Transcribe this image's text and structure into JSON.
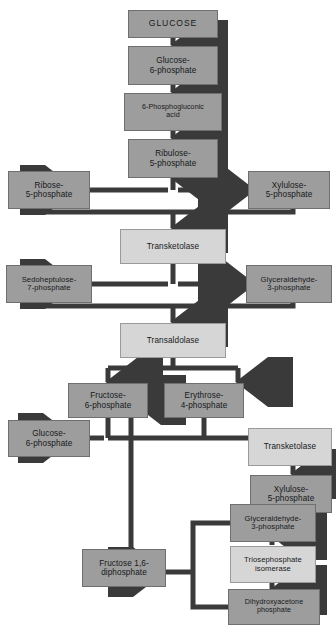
{
  "diagram": {
    "colors": {
      "metabolite_fill": "#9d9d9d",
      "enzyme_fill": "#d6d6d6",
      "arrow": "#3a3a3a",
      "border": "#6f6f6f",
      "text": "#16181a",
      "background": "#ffffff"
    },
    "nodes": [
      {
        "id": "glucose",
        "kind": "metabolite",
        "label": "GLUCOSE"
      },
      {
        "id": "g6p_top",
        "kind": "metabolite",
        "line1": "Glucose-",
        "line2": "6-phosphate"
      },
      {
        "id": "pga",
        "kind": "metabolite",
        "line1": "6-Phosphogluconic",
        "line2": "acid"
      },
      {
        "id": "ribulose5p",
        "kind": "metabolite",
        "line1": "Ribulose-",
        "line2": "5-phosphate"
      },
      {
        "id": "ribose5p",
        "kind": "metabolite",
        "line1": "Ribose-",
        "line2": "5-phosphate"
      },
      {
        "id": "xylulose5p_top",
        "kind": "metabolite",
        "line1": "Xylulose-",
        "line2": "5-phosphate"
      },
      {
        "id": "transketolase1",
        "kind": "enzyme",
        "label": "Transketolase"
      },
      {
        "id": "sedo7p",
        "kind": "metabolite",
        "line1": "Sedoheptulose-",
        "line2": "7-phosphate"
      },
      {
        "id": "gap_mid",
        "kind": "metabolite",
        "line1": "Glyceraldehyde-",
        "line2": "3-phosphate"
      },
      {
        "id": "transaldolase",
        "kind": "enzyme",
        "label": "Transaldolase"
      },
      {
        "id": "fructose6p",
        "kind": "metabolite",
        "line1": "Fructose-",
        "line2": "6-phosphate"
      },
      {
        "id": "erythrose4p",
        "kind": "metabolite",
        "line1": "Erythrose-",
        "line2": "4-phosphate"
      },
      {
        "id": "g6p_bottom",
        "kind": "metabolite",
        "line1": "Glucose-",
        "line2": "6-phosphate"
      },
      {
        "id": "transketolase2",
        "kind": "enzyme",
        "label": "Transketolase"
      },
      {
        "id": "xylulose5p_bot",
        "kind": "metabolite",
        "line1": "Xylulose-",
        "line2": "5-phosphate"
      },
      {
        "id": "gap_bottom",
        "kind": "metabolite",
        "line1": "Glyceraldehyde-",
        "line2": "3-phosphate"
      },
      {
        "id": "tpi",
        "kind": "enzyme",
        "line1": "Triosephosphate",
        "line2": "isomerase"
      },
      {
        "id": "dhap",
        "kind": "metabolite",
        "line1": "Dihydroxyacetone",
        "line2": "phosphate"
      },
      {
        "id": "fdp",
        "kind": "metabolite",
        "line1": "Fructose 1,6-",
        "line2": "diphosphate"
      }
    ],
    "edges": [
      {
        "from": "glucose",
        "to": "g6p_top",
        "style": "arrow-down"
      },
      {
        "from": "g6p_top",
        "to": "pga",
        "style": "arrow-down"
      },
      {
        "from": "pga",
        "to": "ribulose5p",
        "style": "arrow-down"
      },
      {
        "from": "ribulose5p",
        "to": "ribose5p",
        "style": "arrow-left"
      },
      {
        "from": "ribulose5p",
        "to": "xylulose5p_top",
        "style": "arrow-right"
      },
      {
        "from": "ribose5p",
        "to": "transketolase1",
        "style": "elbow-down"
      },
      {
        "from": "xylulose5p_top",
        "to": "transketolase1",
        "style": "elbow-down"
      },
      {
        "from": "transketolase1",
        "to": "sedo7p",
        "style": "arrow-left"
      },
      {
        "from": "transketolase1",
        "to": "gap_mid",
        "style": "arrow-right"
      },
      {
        "from": "sedo7p",
        "to": "transaldolase",
        "style": "elbow-down"
      },
      {
        "from": "gap_mid",
        "to": "transaldolase",
        "style": "elbow-down"
      },
      {
        "from": "transaldolase",
        "to": "fructose6p",
        "style": "fork-down-left"
      },
      {
        "from": "transaldolase",
        "to": "erythrose4p",
        "style": "fork-down-right"
      },
      {
        "from": "fructose6p",
        "to": "g6p_bottom",
        "style": "elbow-left"
      },
      {
        "from": "erythrose4p",
        "to": "transketolase2",
        "style": "elbow-right"
      },
      {
        "from": "transketolase2",
        "to": "xylulose5p_bot",
        "style": "arrow-down"
      },
      {
        "from": "fdp",
        "to": "fructose6p",
        "style": "arrow-up"
      },
      {
        "from": "gap_bottom",
        "to": "fdp",
        "style": "elbow-left"
      },
      {
        "from": "dhap",
        "to": "fdp",
        "style": "elbow-left"
      },
      {
        "from": "tpi",
        "to": "gap_bottom",
        "style": "arrow-up"
      },
      {
        "from": "tpi",
        "to": "dhap",
        "style": "arrow-down"
      }
    ]
  }
}
